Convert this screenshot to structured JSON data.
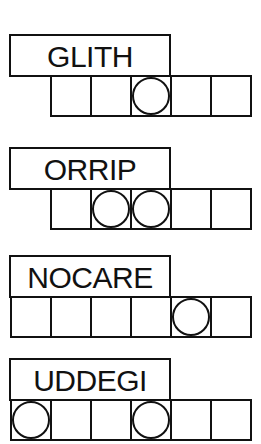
{
  "puzzles": [
    {
      "scrambled": "GLITH",
      "cells": 5,
      "circled": [
        3
      ]
    },
    {
      "scrambled": "ORRIP",
      "cells": 5,
      "circled": [
        2,
        3
      ]
    },
    {
      "scrambled": "NOCARE",
      "cells": 6,
      "circled": [
        5
      ]
    },
    {
      "scrambled": "UDDEGI",
      "cells": 6,
      "circled": [
        1,
        4
      ]
    }
  ],
  "colors": {
    "ink": "#111111",
    "paper": "#ffffff"
  }
}
